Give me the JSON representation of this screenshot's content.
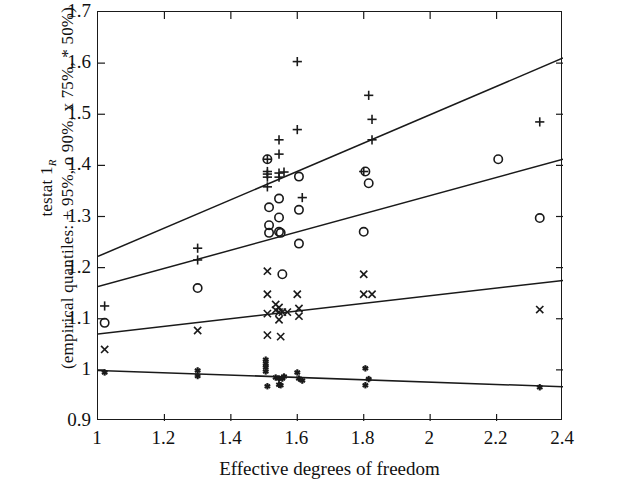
{
  "chart_data": {
    "type": "scatter",
    "title": "",
    "xlabel": "Effective degrees of freedom",
    "ylabel_line1": "testat 1",
    "ylabel_line1_sub": "R",
    "ylabel_line2": "(empirical quantiles: + 95%, o 90%, x 75%, * 50%)",
    "xlim": [
      1,
      2.4
    ],
    "ylim": [
      0.9,
      1.7
    ],
    "xticks": [
      1,
      1.2,
      1.4,
      1.6,
      1.8,
      2,
      2.2,
      2.4
    ],
    "xticklabels": [
      "1",
      "1.2",
      "1.4",
      "1.6",
      "1.8",
      "2",
      "2.2",
      "2.4"
    ],
    "yticks": [
      0.9,
      1.0,
      1.1,
      1.2,
      1.3,
      1.4,
      1.5,
      1.6,
      1.7
    ],
    "yticklabels": [
      "0.9",
      "1",
      "1.1",
      "1.2",
      "1.3",
      "1.4",
      "1.5",
      "1.6",
      "1.7"
    ],
    "grid": false,
    "legend": "none",
    "marker_color": "#1a1a1a",
    "line_color": "#1a1a1a",
    "series": [
      {
        "name": "95% empirical quantile",
        "marker": "+",
        "points": [
          [
            1.02,
            1.125
          ],
          [
            1.3,
            1.238
          ],
          [
            1.3,
            1.215
          ],
          [
            1.51,
            1.412
          ],
          [
            1.51,
            1.388
          ],
          [
            1.51,
            1.383
          ],
          [
            1.51,
            1.377
          ],
          [
            1.51,
            1.358
          ],
          [
            1.545,
            1.45
          ],
          [
            1.545,
            1.422
          ],
          [
            1.545,
            1.385
          ],
          [
            1.545,
            1.377
          ],
          [
            1.56,
            1.387
          ],
          [
            1.6,
            1.47
          ],
          [
            1.6,
            1.603
          ],
          [
            1.615,
            1.337
          ],
          [
            1.8,
            1.388
          ],
          [
            1.815,
            1.537
          ],
          [
            1.825,
            1.45
          ],
          [
            1.825,
            1.49
          ],
          [
            2.33,
            1.485
          ]
        ]
      },
      {
        "name": "90% empirical quantile",
        "marker": "o",
        "points": [
          [
            1.02,
            1.092
          ],
          [
            1.3,
            1.16
          ],
          [
            1.51,
            1.412
          ],
          [
            1.515,
            1.318
          ],
          [
            1.515,
            1.283
          ],
          [
            1.515,
            1.268
          ],
          [
            1.545,
            1.335
          ],
          [
            1.545,
            1.298
          ],
          [
            1.545,
            1.27
          ],
          [
            1.55,
            1.268
          ],
          [
            1.555,
            1.187
          ],
          [
            1.605,
            1.378
          ],
          [
            1.605,
            1.313
          ],
          [
            1.605,
            1.247
          ],
          [
            1.805,
            1.388
          ],
          [
            1.815,
            1.365
          ],
          [
            1.8,
            1.27
          ],
          [
            2.205,
            1.412
          ],
          [
            2.33,
            1.297
          ]
        ]
      },
      {
        "name": "75% empirical quantile",
        "marker": "x",
        "points": [
          [
            1.02,
            1.04
          ],
          [
            1.3,
            1.077
          ],
          [
            1.51,
            1.193
          ],
          [
            1.51,
            1.148
          ],
          [
            1.51,
            1.11
          ],
          [
            1.51,
            1.068
          ],
          [
            1.535,
            1.128
          ],
          [
            1.535,
            1.117
          ],
          [
            1.545,
            1.122
          ],
          [
            1.545,
            1.113
          ],
          [
            1.545,
            1.098
          ],
          [
            1.55,
            1.065
          ],
          [
            1.555,
            1.113
          ],
          [
            1.6,
            1.148
          ],
          [
            1.605,
            1.12
          ],
          [
            1.605,
            1.105
          ],
          [
            1.57,
            1.113
          ],
          [
            1.8,
            1.187
          ],
          [
            1.8,
            1.148
          ],
          [
            1.825,
            1.148
          ],
          [
            2.33,
            1.118
          ]
        ]
      },
      {
        "name": "50% empirical quantile",
        "marker": "*",
        "points": [
          [
            1.02,
            0.995
          ],
          [
            1.3,
            0.999
          ],
          [
            1.3,
            0.988
          ],
          [
            1.505,
            1.02
          ],
          [
            1.505,
            1.012
          ],
          [
            1.505,
            1.005
          ],
          [
            1.505,
            0.997
          ],
          [
            1.51,
            0.968
          ],
          [
            1.535,
            0.985
          ],
          [
            1.545,
            0.983
          ],
          [
            1.545,
            0.971
          ],
          [
            1.55,
            0.97
          ],
          [
            1.555,
            0.983
          ],
          [
            1.56,
            0.987
          ],
          [
            1.6,
            0.995
          ],
          [
            1.605,
            0.983
          ],
          [
            1.615,
            0.979
          ],
          [
            1.805,
            1.003
          ],
          [
            1.815,
            0.982
          ],
          [
            1.805,
            0.97
          ],
          [
            2.33,
            0.966
          ]
        ]
      }
    ],
    "fit_lines": [
      {
        "name": "fit-95",
        "x": [
          1,
          2.4
        ],
        "y": [
          1.222,
          1.61
        ]
      },
      {
        "name": "fit-90",
        "x": [
          1,
          2.4
        ],
        "y": [
          1.163,
          1.412
        ]
      },
      {
        "name": "fit-75",
        "x": [
          1,
          2.4
        ],
        "y": [
          1.07,
          1.175
        ]
      },
      {
        "name": "fit-50",
        "x": [
          1,
          2.4
        ],
        "y": [
          0.999,
          0.967
        ]
      }
    ]
  }
}
